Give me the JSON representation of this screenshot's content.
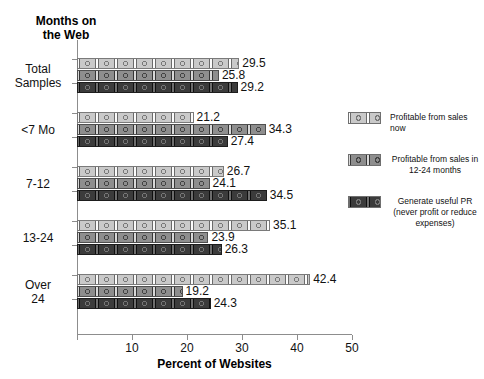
{
  "chart": {
    "yaxis_title": "Months on\nthe Web",
    "xaxis_title": "Percent of Websites"
  },
  "chart_data": {
    "type": "bar",
    "orientation": "horizontal",
    "title": "",
    "xlabel": "Percent of Websites",
    "ylabel": "Months on the Web",
    "xlim": [
      0,
      50
    ],
    "xticks": [
      0,
      10,
      20,
      30,
      40,
      50
    ],
    "xtick_labels": [
      "",
      "10",
      "20",
      "30",
      "40",
      "50"
    ],
    "grid": false,
    "legend_position": "right",
    "categories": [
      "Total\nSamples",
      "<7 Mo",
      "7-12",
      "13-24",
      "Over\n24"
    ],
    "category_labels": [
      "Total Samples",
      "<7 Mo",
      "7-12",
      "13-24",
      "Over 24"
    ],
    "series": [
      {
        "name": "Profitable from sales now",
        "color": "#c9c9c9",
        "values": [
          29.5,
          21.2,
          26.7,
          35.1,
          42.4
        ]
      },
      {
        "name": "Profitable from sales in 12-24 months",
        "color": "#8e8e8e",
        "values": [
          25.8,
          34.3,
          24.1,
          23.9,
          19.2
        ]
      },
      {
        "name": "Generate useful PR (never profit or reduce expenses)",
        "color": "#3b3b3b",
        "values": [
          29.2,
          27.4,
          34.5,
          26.3,
          24.3
        ]
      }
    ]
  },
  "legend": {
    "items": [
      {
        "label": "Profitable from sales now",
        "swatch": "#c9c9c9"
      },
      {
        "label": "Profitable from sales in\n12-24 months",
        "swatch": "#8e8e8e"
      },
      {
        "label": "Generate useful PR\n(never profit or reduce\nexpenses)",
        "swatch": "#3b3b3b"
      }
    ]
  }
}
